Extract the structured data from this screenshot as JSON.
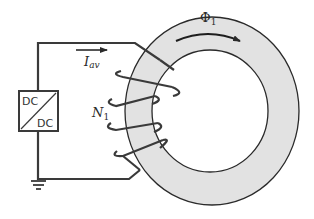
{
  "diagram": {
    "source": {
      "label_top": "DC",
      "label_bottom": "DC",
      "type": "DC/DC converter"
    },
    "current": {
      "symbol": "I",
      "subscript": "av",
      "direction": "right"
    },
    "winding": {
      "symbol": "N",
      "subscript": "1",
      "turns_visible": 4
    },
    "flux": {
      "symbol": "Φ",
      "subscript": "1",
      "direction": "clockwise"
    },
    "ground": {
      "present": true
    },
    "colors": {
      "wire": "#3a3a3a",
      "core_fill": "#e2e2e2",
      "core_edge": "#2a2a2a",
      "background": "#ffffff"
    }
  }
}
